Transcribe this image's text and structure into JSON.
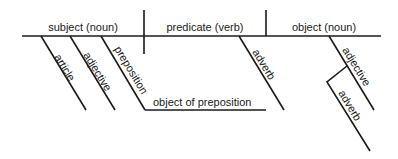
{
  "diagram": {
    "type": "sentence diagram",
    "main_line": {
      "subject": "subject (noun)",
      "predicate": "predicate (verb)",
      "object": "object (noun)"
    },
    "subject_modifiers": {
      "article": "article",
      "adjective": "adjective",
      "preposition": "preposition",
      "object_of_preposition": "object of preposition"
    },
    "predicate_modifiers": {
      "adverb": "adverb"
    },
    "object_modifiers": {
      "adjective": "adjective",
      "adverb": "adverb"
    },
    "colors": {
      "line": "#1a1a1a",
      "text": "#1a1a1a",
      "background": "#ffffff"
    }
  }
}
